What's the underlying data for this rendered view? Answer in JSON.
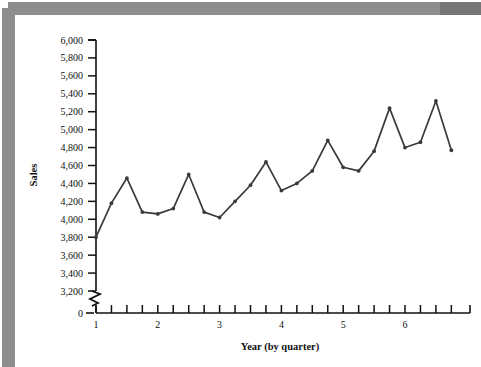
{
  "chart_data": {
    "type": "line",
    "title": "",
    "xlabel": "Year (by quarter)",
    "ylabel": "Sales",
    "ylim": [
      3200,
      6000
    ],
    "y_axis_break": true,
    "y_break_label": "0",
    "x_axis_break": true,
    "grid": false,
    "legend": "none",
    "marker": "dot",
    "line_color": "#3a3a3a",
    "ytick_labels": [
      "6,000",
      "5,800",
      "5,600",
      "5,400",
      "5,200",
      "5,000",
      "4,800",
      "4,600",
      "4,400",
      "4,200",
      "4,000",
      "3,800",
      "3,600",
      "3,400",
      "3,200",
      "0"
    ],
    "ytick_values": [
      6000,
      5800,
      5600,
      5400,
      5200,
      5000,
      4800,
      4600,
      4400,
      4200,
      4000,
      3800,
      3600,
      3400,
      3200
    ],
    "xtick_labels": [
      "1",
      "",
      "",
      "",
      "2",
      "",
      "",
      "",
      "3",
      "",
      "",
      "",
      "4",
      "",
      "",
      "",
      "5",
      "",
      "",
      "",
      "6",
      "",
      "",
      ""
    ],
    "xtick_major": [
      1,
      2,
      3,
      4,
      5,
      6
    ],
    "x": [
      1,
      2,
      3,
      4,
      5,
      6,
      7,
      8,
      9,
      10,
      11,
      12,
      13,
      14,
      15,
      16,
      17,
      18,
      19,
      20,
      21,
      22,
      23,
      24
    ],
    "x_period_labels": [
      "Y1Q1",
      "Y1Q2",
      "Y1Q3",
      "Y1Q4",
      "Y2Q1",
      "Y2Q2",
      "Y2Q3",
      "Y2Q4",
      "Y3Q1",
      "Y3Q2",
      "Y3Q3",
      "Y3Q4",
      "Y4Q1",
      "Y4Q2",
      "Y4Q3",
      "Y4Q4",
      "Y5Q1",
      "Y5Q2",
      "Y5Q3",
      "Y5Q4",
      "Y6Q1",
      "Y6Q2",
      "Y6Q3",
      "Y6Q4"
    ],
    "values": [
      3800,
      4180,
      4460,
      4080,
      4060,
      4120,
      4500,
      4080,
      4020,
      4200,
      4380,
      4640,
      4320,
      4400,
      4540,
      4880,
      4580,
      4540,
      4760,
      5240,
      4800,
      4860,
      5320,
      4770
    ],
    "series": [
      {
        "name": "Sales",
        "values": [
          3800,
          4180,
          4460,
          4080,
          4060,
          4120,
          4500,
          4080,
          4020,
          4200,
          4380,
          4640,
          4320,
          4400,
          4540,
          4880,
          4580,
          4540,
          4760,
          5240,
          4800,
          4860,
          5320,
          4770
        ]
      }
    ]
  },
  "axis": {
    "y_title": "Sales",
    "x_title": "Year (by quarter)"
  }
}
